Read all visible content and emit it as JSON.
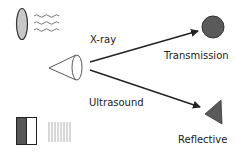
{
  "labels": {
    "xray": "X-ray",
    "ultrasound": "Ultrasound",
    "transmission": "Transmission",
    "reflective": "Reflective"
  },
  "icons": {
    "source_top": "gray-ellipse-with-waves-icon",
    "source_bottom": "half-filled-box-with-vertical-lines-icon",
    "emitter": "cone-icon",
    "transmission_target": "filled-circle-icon",
    "reflective_target": "filled-triangle-icon"
  },
  "colors": {
    "ellipse_fill": "#c8c8c8",
    "target_fill": "#5a5a5a",
    "stroke": "#222222",
    "box_dark": "#555555",
    "lines_light": "#b0b0b0"
  }
}
